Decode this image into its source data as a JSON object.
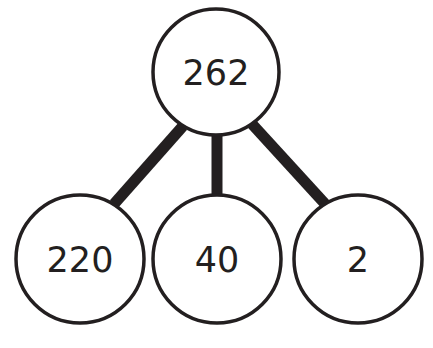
{
  "diagram": {
    "type": "part-whole number bond",
    "colors": {
      "stroke": "#231f20",
      "fill": "#ffffff",
      "text": "#231f20"
    },
    "root": {
      "label": "262",
      "cx": 216,
      "cy": 72,
      "r": 63
    },
    "children": [
      {
        "label": "220",
        "cx": 80,
        "cy": 259,
        "r": 64
      },
      {
        "label": "40",
        "cx": 217,
        "cy": 259,
        "r": 64
      },
      {
        "label": "2",
        "cx": 358,
        "cy": 259,
        "r": 64
      }
    ],
    "connectors": [
      {
        "from": "262",
        "to": "220",
        "x1": 183,
        "y1": 126,
        "x2": 114,
        "y2": 204
      },
      {
        "from": "262",
        "to": "40",
        "x1": 217,
        "y1": 135,
        "x2": 217,
        "y2": 196
      },
      {
        "from": "262",
        "to": "2",
        "x1": 252,
        "y1": 124,
        "x2": 327,
        "y2": 206
      }
    ]
  }
}
